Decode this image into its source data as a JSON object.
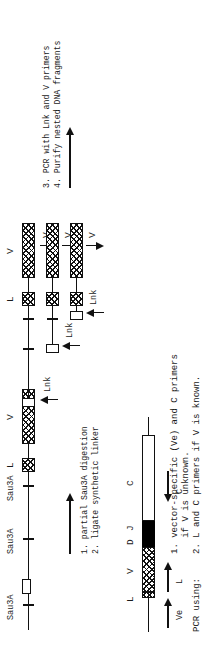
{
  "figure": {
    "orientation": "rotated-90-ccw"
  },
  "panel_top": {
    "restriction_labels": [
      "Sau3A",
      "Sau3A",
      "Sau3A"
    ],
    "segment_labels": {
      "linker": "L",
      "variable": "V"
    },
    "steps": [
      "1. partial Sau3A digestion",
      "2. ligate synthetic linker"
    ],
    "legend_label": "ligate synthetic linker",
    "products": [
      {
        "lnk_label": "Lnk",
        "v_label": "V",
        "l_label": "L"
      },
      {
        "lnk_label": "Lnk",
        "v_label": "V",
        "l_label": "L"
      },
      {
        "lnk_label": "Lnk",
        "v_label": "V",
        "l_label": "L"
      }
    ],
    "steps_right": [
      "3. PCR with Lnk and V primers",
      "4. Purify nested DNA fragments"
    ]
  },
  "panel_bottom": {
    "segment_labels": {
      "linker": "L",
      "variable": "V",
      "diversity": "D",
      "joining": "J",
      "constant": "C"
    },
    "primer_labels": {
      "vector": "Ve",
      "linker": "L",
      "constant": "C"
    },
    "caption_lead": "PCR using:",
    "caption_lines": [
      "1. vector-specific (Ve) and C primers",
      "   if V is unknown.",
      "2. L and C primers if V is known."
    ]
  },
  "colors": {
    "ink": "#111111",
    "paper": "#ffffff",
    "solid_segment": "#000000"
  }
}
